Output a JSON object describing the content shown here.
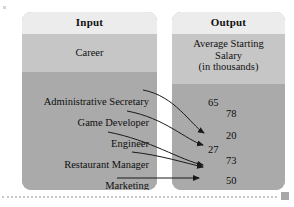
{
  "diagram": {
    "input_column": {
      "title": "Input",
      "subtitle": "Career",
      "items": [
        "Administrative Secretary",
        "Game Developer",
        "Engineer",
        "Restaurant Manager",
        "Marketing"
      ]
    },
    "output_column": {
      "title": "Output",
      "subtitle_line1": "Average Starting",
      "subtitle_line2": "Salary",
      "subtitle_line3": "(in thousands)",
      "values": [
        "65",
        "78",
        "20",
        "27",
        "73",
        "50",
        "35"
      ]
    },
    "mappings": [
      {
        "from": "Administrative Secretary",
        "to": "27"
      },
      {
        "from": "Game Developer",
        "to": "73"
      },
      {
        "from": "Engineer",
        "to": "50"
      },
      {
        "from": "Restaurant Manager",
        "to": "50"
      },
      {
        "from": "Marketing",
        "to": "35"
      }
    ],
    "colors": {
      "header_band": "#ececec",
      "subtitle_band": "#c6c6c6",
      "body_band": "#aaaaaa",
      "arrow": "#1a1a1a",
      "rule": "#c9c9c9",
      "marker": "#a8a8a8"
    }
  }
}
